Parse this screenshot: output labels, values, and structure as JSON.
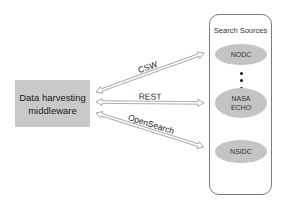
{
  "diagram": {
    "middleware": {
      "line1": "Data harvesting",
      "line2": "middleware",
      "fill": "#c9c9c9"
    },
    "search_sources": {
      "title": "Search Sources",
      "nodes": [
        {
          "id": "nodc",
          "label_line1": "NODC",
          "label_line2": ""
        },
        {
          "id": "nasa-echo",
          "label_line1": "NASA",
          "label_line2": "ECHO"
        },
        {
          "id": "nsidc",
          "label_line1": "NSIDC",
          "label_line2": ""
        }
      ],
      "ellipsis_dots": 3,
      "node_fill": "#c4c4c4"
    },
    "connections": [
      {
        "label": "CSW",
        "from": "middleware",
        "to": "nodc",
        "direction": "bidirectional"
      },
      {
        "label": "REST",
        "from": "middleware",
        "to": "nasa-echo",
        "direction": "bidirectional"
      },
      {
        "label": "OpenSearch",
        "from": "middleware",
        "to": "nsidc",
        "direction": "bidirectional"
      }
    ]
  }
}
